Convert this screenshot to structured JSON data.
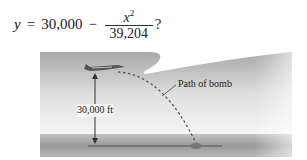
{
  "equation": {
    "lhs": "y",
    "equals": "=",
    "constant": "30,000",
    "minus": "−",
    "numerator": "x",
    "exponent": "2",
    "denominator": "39,204",
    "trailing": "?"
  },
  "figure": {
    "height_label": "30,000 ft",
    "path_label": "Path of bomb",
    "colors": {
      "sky_dark": "#a9a9a9",
      "sky_light": "#f4f4f4",
      "ground_dark": "#8c8c8c",
      "ground_light": "#c8c8c8",
      "path": "#555555"
    }
  }
}
